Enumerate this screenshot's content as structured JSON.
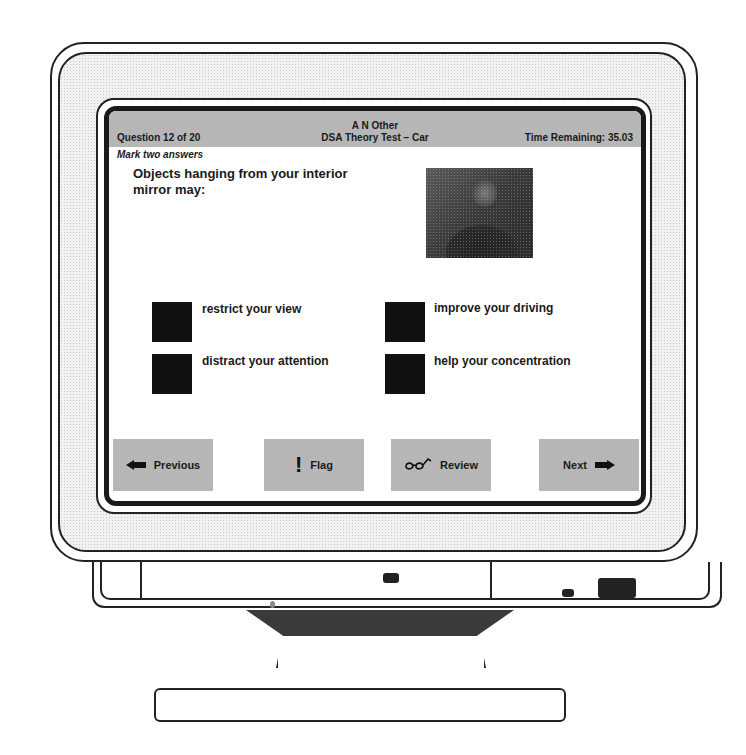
{
  "header": {
    "candidate_name": "A N Other",
    "test_name": "DSA Theory Test – Car",
    "question_counter": "Question 12 of 20",
    "time_remaining": "Time Remaining: 35.03"
  },
  "instruction": "Mark two answers",
  "question": {
    "text": "Objects hanging from your interior mirror may:",
    "image": "photo-woman-in-car"
  },
  "answers": [
    {
      "label": "restrict your view",
      "selected": false
    },
    {
      "label": "improve your driving",
      "selected": false
    },
    {
      "label": "distract your attention",
      "selected": false
    },
    {
      "label": "help your concentration",
      "selected": false
    }
  ],
  "buttons": {
    "previous": {
      "label": "Previous",
      "icon": "arrow-left-icon"
    },
    "flag": {
      "label": "Flag",
      "icon": "exclamation-icon"
    },
    "review": {
      "label": "Review",
      "icon": "glasses-icon"
    },
    "next": {
      "label": "Next",
      "icon": "arrow-right-icon"
    }
  },
  "colors": {
    "bar_gray": "#c6c6c6",
    "answer_box": "#111111",
    "text": "#1a1a1a"
  }
}
